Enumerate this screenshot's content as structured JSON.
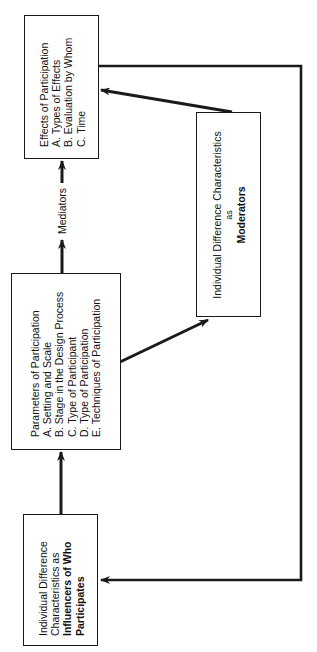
{
  "diagram": {
    "orientation": "rotated-90-ccw",
    "boxes": {
      "effects": {
        "title": "Effects of Participation",
        "items": [
          "A. Types of Effects",
          "B. Evaluation by Whom",
          "C. Time"
        ]
      },
      "parameters": {
        "title": "Parameters of Participation",
        "items": [
          "A. Setting and Scale",
          "B. Stage in the Design Process",
          "C. Type of Participant",
          "D. Type of Participation",
          "E. Techniques of Participation"
        ]
      },
      "moderators": {
        "line1": "Individual Difference Characteristics",
        "line2": "as",
        "line3": "Moderators"
      },
      "influencers": {
        "line1": "Individual Difference",
        "line2": "Characteristics as",
        "line3": "Influencers of Who",
        "line4": "Participates"
      }
    },
    "edges": [
      {
        "from": "influencers",
        "to": "parameters",
        "label": ""
      },
      {
        "from": "parameters",
        "to": "effects",
        "label": "Mediators"
      },
      {
        "from": "parameters",
        "to": "moderators",
        "label": ""
      },
      {
        "from": "moderators",
        "to": "effects",
        "label": ""
      },
      {
        "from": "effects",
        "to": "influencers",
        "label": "",
        "style": "feedback-loop"
      }
    ],
    "mediators_label": "Mediators",
    "colors": {
      "line": "#1a1a1a",
      "background": "#ffffff"
    }
  }
}
